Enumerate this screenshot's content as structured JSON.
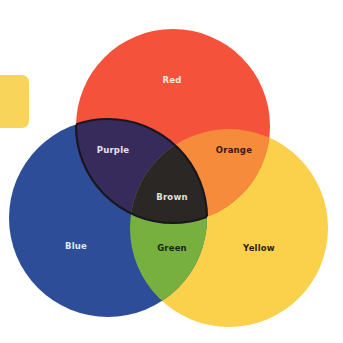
{
  "diagram": {
    "type": "venn",
    "tab_color": "#f9d45a",
    "circles": [
      {
        "id": "red",
        "label": "Red",
        "color": "#f4523a",
        "cx": 173,
        "cy": 126,
        "r": 97
      },
      {
        "id": "blue",
        "label": "Blue",
        "color": "#2e4d99",
        "cx": 108,
        "cy": 218,
        "r": 99
      },
      {
        "id": "yellow",
        "label": "Yellow",
        "color": "#fbd04a",
        "cx": 229,
        "cy": 228,
        "r": 99
      }
    ],
    "regions": {
      "red": {
        "label": "Red",
        "color": "#f4523a",
        "text_color": "#fde6df"
      },
      "blue": {
        "label": "Blue",
        "color": "#2e4d99",
        "text_color": "#dfe6f5"
      },
      "yellow": {
        "label": "Yellow",
        "color": "#fbd04a",
        "text_color": "#2a1f10"
      },
      "purple": {
        "label": "Purple",
        "color": "#372b5c",
        "text_color": "#e6e0f0"
      },
      "orange": {
        "label": "Orange",
        "color": "#f58b3b",
        "text_color": "#3a1a0c"
      },
      "green": {
        "label": "Green",
        "color": "#77b03f",
        "text_color": "#16260c"
      },
      "brown": {
        "label": "Brown",
        "color": "#2a2725",
        "text_color": "#e4e0dc"
      }
    }
  }
}
